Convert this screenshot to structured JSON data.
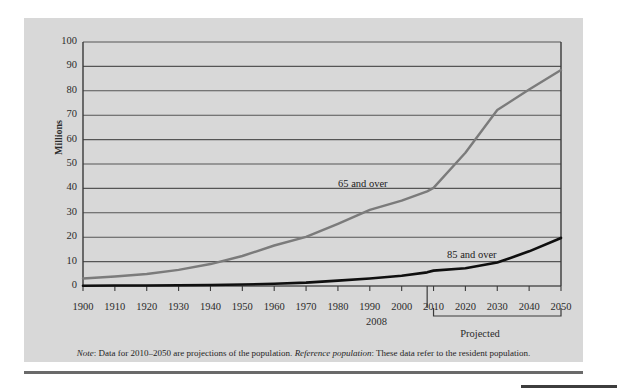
{
  "figure": {
    "note_prefix": "Note",
    "note_text_1": ": Data for 2010–2050 are projections of the population. ",
    "note_emphasis": "Reference population",
    "note_text_2": ": These data refer to the resident population.",
    "note_full": "Note: Data for 2010–2050 are projections of the population. Reference population: These data refer to the resident population.",
    "projected_label": "Projected",
    "marker_2008": "2008",
    "panel_color": "#d8d8d8",
    "series_65_color": "#7b7b7b",
    "series_85_color": "#0f0f0f",
    "gridline_color": "#555555",
    "axis_color": "#3a3a3a"
  },
  "chart_data": {
    "type": "line",
    "title": "",
    "xlabel": "",
    "ylabel": "Millions",
    "xlim": [
      1900,
      2050
    ],
    "ylim": [
      0,
      100
    ],
    "ytick_values": [
      0,
      10,
      20,
      30,
      40,
      50,
      60,
      70,
      80,
      90,
      100
    ],
    "ytick_labels": [
      "0",
      "10",
      "20",
      "30",
      "40",
      "50",
      "60",
      "70",
      "80",
      "90",
      "100"
    ],
    "xtick_values": [
      1900,
      1910,
      1920,
      1930,
      1940,
      1950,
      1960,
      1970,
      1980,
      1990,
      2000,
      2010,
      2020,
      2030,
      2040,
      2050
    ],
    "xtick_labels": [
      "1900",
      "1910",
      "1920",
      "1930",
      "1940",
      "1950",
      "1960",
      "1970",
      "1980",
      "1990",
      "2000",
      "2010",
      "2020",
      "2030",
      "2040",
      "2050"
    ],
    "grid": true,
    "legend_position": "inline-annotation",
    "annotations": [
      {
        "text": "65 and over",
        "x": 1985,
        "y": 45
      },
      {
        "text": "85 and over",
        "x": 2028,
        "y": 15
      },
      {
        "text": "2008",
        "x": 2008,
        "y": 0
      },
      {
        "text": "Projected",
        "x": 2030,
        "y": 0
      }
    ],
    "projection_range": [
      2010,
      2050
    ],
    "x": [
      1900,
      1910,
      1920,
      1930,
      1940,
      1950,
      1960,
      1970,
      1980,
      1990,
      2000,
      2008,
      2010,
      2020,
      2030,
      2040,
      2050
    ],
    "series": [
      {
        "name": "65 and over",
        "color": "#7b7b7b",
        "values": [
          3.1,
          3.9,
          4.9,
          6.6,
          9.0,
          12.3,
          16.6,
          20.1,
          25.5,
          31.2,
          35.0,
          38.8,
          40.2,
          54.6,
          72.1,
          80.5,
          88.5
        ]
      },
      {
        "name": "85 and over",
        "color": "#0f0f0f",
        "values": [
          0.1,
          0.2,
          0.2,
          0.3,
          0.4,
          0.6,
          0.9,
          1.4,
          2.2,
          3.1,
          4.2,
          5.6,
          6.3,
          7.3,
          9.6,
          14.2,
          19.7
        ]
      }
    ]
  }
}
